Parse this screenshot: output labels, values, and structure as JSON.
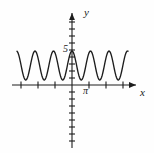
{
  "figure": {
    "type": "cartesian-plot",
    "background": "#fefefe",
    "stroke_color": "#1d1d1d"
  },
  "axes": {
    "x_label": "x",
    "y_label": "y",
    "origin_px": [
      72,
      85
    ],
    "x_axis_y_px": 85,
    "y_axis_x_px": 72,
    "x_tick_spacing_px": 17,
    "y_tick_spacing_px": 7,
    "x_ticks_left": 3,
    "x_ticks_right": 3,
    "y_ticks_up": 10,
    "y_ticks_down": 9,
    "tick_half_len_x_px": 3.5,
    "tick_half_len_y_px": 3
  },
  "annotations": {
    "pi_label": "π",
    "pi_tick_index": 2,
    "five_label": "5",
    "five_value": 5
  },
  "chart_data": {
    "type": "line",
    "title": "",
    "xlabel": "x",
    "ylabel": "y",
    "grid": false,
    "legend": false,
    "function": "y = 2.5 + 2.5*cos(6x)",
    "amplitude": 2.5,
    "midline": 2.5,
    "max": 5,
    "min": 0,
    "cycles_visible": 6,
    "cycles_left_of_axis": 3,
    "cycles_right_of_axis": 3,
    "x_range_px": [
      17,
      128
    ],
    "y_peak_px": 51,
    "y_trough_px": 80,
    "period_px": 18.5,
    "xlim": [
      -3.2,
      3.2
    ],
    "ylim": [
      0,
      5
    ],
    "x": [
      -3.2,
      -3.0,
      -2.8,
      -2.6,
      -2.4,
      -2.2,
      -2.0,
      -1.8,
      -1.6,
      -1.4,
      -1.2,
      -1.0,
      -0.8,
      -0.6,
      -0.4,
      -0.2,
      0.0,
      0.2,
      0.4,
      0.6,
      0.8,
      1.0,
      1.2,
      1.4,
      1.6,
      1.8,
      2.0,
      2.2,
      2.4,
      2.6,
      2.8,
      3.0,
      3.2
    ],
    "values": [
      2.5,
      1.0,
      0.1,
      0.6,
      2.0,
      3.8,
      4.9,
      4.7,
      3.3,
      1.5,
      0.3,
      0.2,
      1.3,
      3.0,
      4.5,
      5.0,
      4.2,
      2.6,
      0.9,
      0.1,
      0.7,
      2.2,
      3.9,
      4.9,
      4.6,
      3.1,
      1.3,
      0.2,
      0.3,
      1.5,
      3.3,
      4.7,
      4.9
    ]
  }
}
